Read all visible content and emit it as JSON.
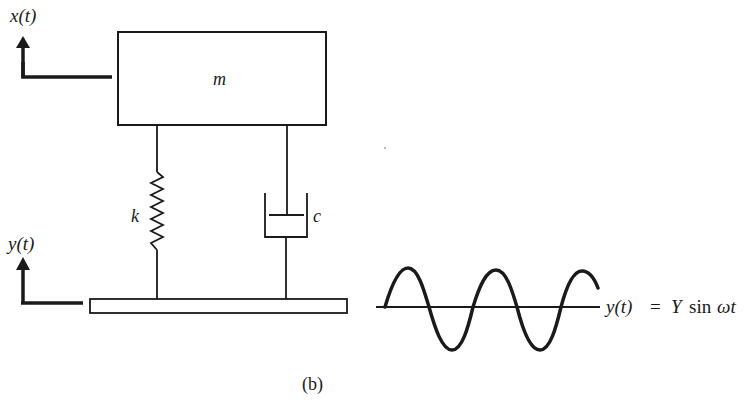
{
  "diagram": {
    "type": "base-excited spring-mass-damper system",
    "labels": {
      "mass": "m",
      "spring": "k",
      "damper": "c",
      "mass_displacement": "x(t)",
      "base_displacement": "y(t)",
      "excitation_lhs": "y(t)",
      "excitation_eq": "=",
      "excitation_amp": "Y",
      "excitation_fn": "sin",
      "excitation_arg": "ωt",
      "caption": "(b)"
    },
    "colors": {
      "stroke": "#1a1a1a",
      "background": "#ffffff"
    },
    "excitation": {
      "form": "y(t) = Y sin ωt",
      "cycles_shown": 2.25
    }
  }
}
